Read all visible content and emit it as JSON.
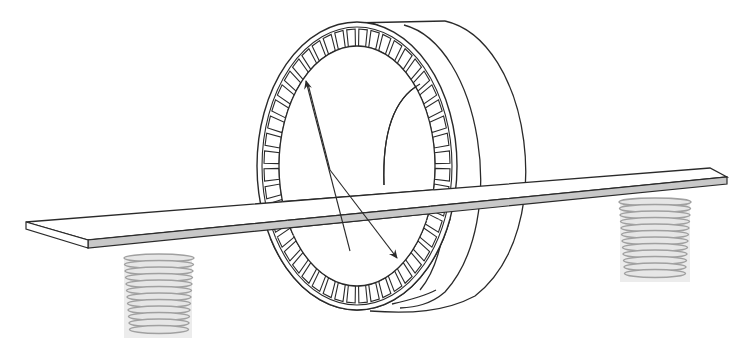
{
  "figure": {
    "title": "Slotted stator ring on support bar",
    "slot_count": 48,
    "colors": {
      "line": "#2a2a2a",
      "bar_edge_fill": "#c8c8c8",
      "post_fill": "#e6e6e6",
      "post_line": "#9a9a9a",
      "background": "#ffffff"
    }
  }
}
